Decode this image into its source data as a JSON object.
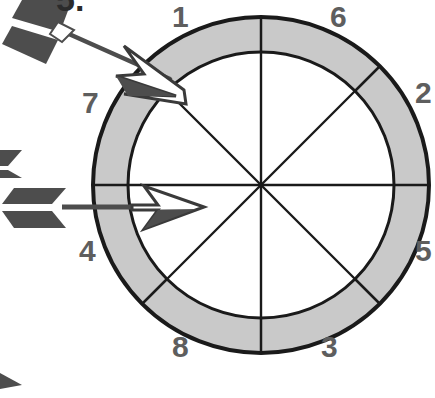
{
  "figure": {
    "kind": "spinner-wheel-diagram",
    "problem_number": "5.",
    "colors": {
      "ring_fill": "#c9c9c9",
      "inner_fill": "#ffffff",
      "outline": "#1a1a1a",
      "spoke": "#1a1a1a",
      "label_text": "#5e5e5e",
      "arrow_shaft": "#4d4d4d",
      "arrow_fletching": "#4d4d4d",
      "arrowhead_fill": "#ffffff",
      "arrowhead_stroke": "#3a3a3a",
      "background": "#ffffff"
    },
    "geometry": {
      "center_x": 261,
      "center_y": 185,
      "outer_radius": 168,
      "inner_radius": 133,
      "sector_count": 8,
      "spoke_angles_deg": [
        0,
        45,
        90,
        135,
        180,
        225,
        270,
        315
      ]
    },
    "sector_labels": [
      {
        "id": "label-1",
        "text": "1",
        "x": 172,
        "y": 2
      },
      {
        "id": "label-6",
        "text": "6",
        "x": 330,
        "y": 2
      },
      {
        "id": "label-2",
        "text": "2",
        "x": 415,
        "y": 78
      },
      {
        "id": "label-5",
        "text": "5",
        "x": 415,
        "y": 236
      },
      {
        "id": "label-3",
        "text": "3",
        "x": 321,
        "y": 332
      },
      {
        "id": "label-8",
        "text": "8",
        "x": 172,
        "y": 332
      },
      {
        "id": "label-4",
        "text": "4",
        "x": 79,
        "y": 236
      },
      {
        "id": "label-7",
        "text": "7",
        "x": 82,
        "y": 88
      }
    ],
    "arrows": [
      {
        "id": "arrow-diagonal",
        "description": "arrow pointing down-right into the ring near sector 1 / 7 boundary",
        "tail_x": 18,
        "tail_y": 18,
        "tip_x": 172,
        "tip_y": 80
      },
      {
        "id": "arrow-horizontal",
        "description": "arrow pointing right through the ring along the horizontal diameter",
        "tail_x": 30,
        "tail_y": 207,
        "tip_x": 202,
        "tip_y": 207
      }
    ],
    "edge_marks": [
      {
        "id": "edge-fletching-left",
        "description": "cropped arrow fletching at left edge"
      },
      {
        "id": "edge-triangle-bottom-left",
        "description": "cropped dark triangle at lower left edge"
      }
    ]
  }
}
